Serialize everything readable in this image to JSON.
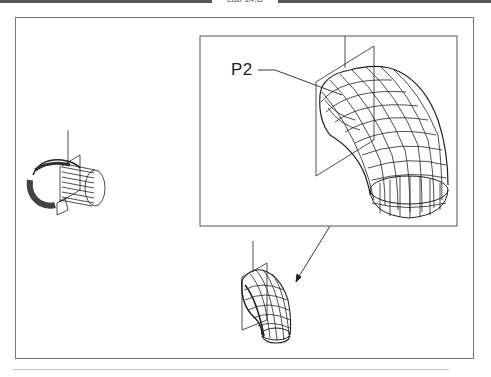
{
  "header": {
    "title": "Lab 14.D"
  },
  "figure": {
    "callout_label": "P2",
    "views": [
      {
        "id": "left-model",
        "description": "Wireframe pipe elbow with cutting plane, initial view"
      },
      {
        "id": "zoom-detail",
        "description": "Enlarged wireframe elbow with plane P2"
      },
      {
        "id": "bottom-model",
        "description": "Wireframe elbow after operation"
      }
    ]
  },
  "colors": {
    "line": "#222222",
    "frame": "#777777",
    "background": "#ffffff"
  }
}
